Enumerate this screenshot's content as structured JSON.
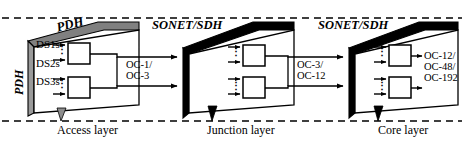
{
  "diagram": {
    "boundaries": {
      "top_label": "dashed-boundary-top",
      "bottom_label": "dashed-boundary-bottom"
    },
    "colors": {
      "line": "#000000",
      "slab_gray_top": "#808080",
      "slab_gray_side": "#9a9a9a",
      "slab_black": "#000000",
      "face_white": "#ffffff",
      "background": "#ffffff"
    },
    "layers": [
      {
        "id": "access",
        "tech_label": "PDH",
        "side_label": "PDH",
        "bottom_label": "Access layer",
        "inputs": [
          "DS1s",
          "DS2s",
          "DS3s"
        ],
        "output_label": "OC-1/\nOC-3",
        "output_lines": [
          "OC-1/",
          "OC-3"
        ],
        "node_count": 2
      },
      {
        "id": "junction",
        "tech_label": "SONET/SDH",
        "bottom_label": "Junction layer",
        "output_lines": [
          "OC-3/",
          "OC-12"
        ],
        "node_count": 2
      },
      {
        "id": "core",
        "tech_label": "SONET/SDH",
        "bottom_label": "Core layer",
        "output_lines": [
          "OC-12/",
          "OC-48/",
          "OC-192"
        ],
        "node_count": 2
      }
    ],
    "ellipsis_glyph": "⋮"
  }
}
